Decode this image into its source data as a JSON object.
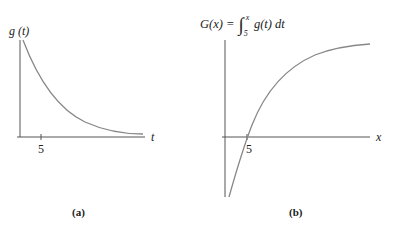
{
  "panel_a": {
    "y_label": "g (t)",
    "x_label": "t",
    "tick_label": "5",
    "caption": "(a)"
  },
  "panel_b": {
    "formula_lhs": "G(x) = ",
    "integral_sign": "∫",
    "upper_limit": "x",
    "lower_limit": "5",
    "integrand": "g(t) dt",
    "x_label": "x",
    "tick_label": "5",
    "caption": "(b)"
  },
  "colors": {
    "axis": "#555555",
    "curve": "#888888",
    "text": "#222222"
  }
}
